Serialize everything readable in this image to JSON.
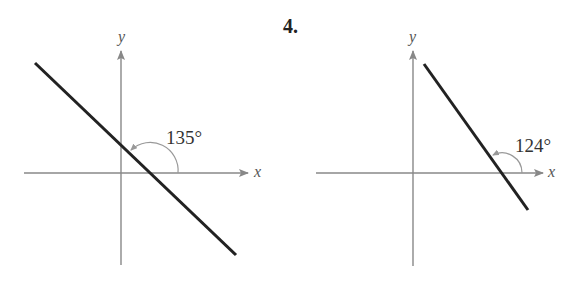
{
  "problem_number": "4.",
  "graphs": [
    {
      "x_label": "x",
      "y_label": "y",
      "angle_label": "135°",
      "angle_degrees": 135
    },
    {
      "x_label": "x",
      "y_label": "y",
      "angle_label": "124°",
      "angle_degrees": 124
    }
  ],
  "colors": {
    "axis": "#888888",
    "line": "#222222",
    "arc": "#999999"
  }
}
